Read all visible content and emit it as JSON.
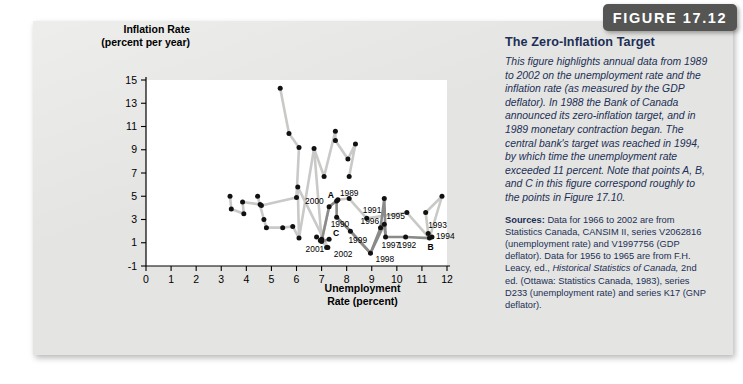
{
  "figure_tag": "FIGURE 17.12",
  "chart_data": {
    "type": "scatter",
    "title": "The Zero-Inflation Target",
    "xlabel": "Unemployment Rate (percent)",
    "xlabel_line1": "Unemployment",
    "xlabel_line2": "Rate (percent)",
    "ylabel": "Inflation Rate (percent per year)",
    "ylabel_line1": "Inflation Rate",
    "ylabel_line2": "(percent per year)",
    "xlim": [
      0,
      12
    ],
    "ylim": [
      -1,
      15
    ],
    "xticks": [
      "0",
      "1",
      "2",
      "3",
      "4",
      "5",
      "6",
      "7",
      "8",
      "9",
      "10",
      "11",
      "12"
    ],
    "yticks": [
      "-1",
      "1",
      "3",
      "5",
      "7",
      "9",
      "11",
      "13",
      "15"
    ],
    "grid": false,
    "legend": "none",
    "series": [
      {
        "name": "Unemployment vs Inflation 1956-2002",
        "points": [
          {
            "label": "",
            "x": 3.35,
            "y": 5.0
          },
          {
            "label": "",
            "x": 3.4,
            "y": 3.9
          },
          {
            "label": "",
            "x": 3.85,
            "y": 4.5
          },
          {
            "label": "",
            "x": 3.9,
            "y": 3.5
          },
          {
            "label": "",
            "x": 4.45,
            "y": 5.0
          },
          {
            "label": "",
            "x": 4.55,
            "y": 4.3
          },
          {
            "label": "",
            "x": 4.6,
            "y": 4.2
          },
          {
            "label": "",
            "x": 4.7,
            "y": 3.0
          },
          {
            "label": "",
            "x": 4.8,
            "y": 2.3
          },
          {
            "label": "",
            "x": 5.35,
            "y": 14.3
          },
          {
            "label": "",
            "x": 5.45,
            "y": 2.3
          },
          {
            "label": "",
            "x": 5.7,
            "y": 10.4
          },
          {
            "label": "",
            "x": 5.85,
            "y": 2.4
          },
          {
            "label": "",
            "x": 6.0,
            "y": 4.9
          },
          {
            "label": "",
            "x": 6.05,
            "y": 5.8
          },
          {
            "label": "",
            "x": 6.1,
            "y": 9.2
          },
          {
            "label": "",
            "x": 6.1,
            "y": 1.4
          },
          {
            "label": "",
            "x": 6.7,
            "y": 9.1
          },
          {
            "label": "",
            "x": 6.8,
            "y": 1.5
          },
          {
            "label": "",
            "x": 6.95,
            "y": 1.2
          },
          {
            "label": "",
            "x": 7.0,
            "y": 1.3
          },
          {
            "label": "2001",
            "x": 7.0,
            "y": 1.1
          },
          {
            "label": "",
            "x": 7.1,
            "y": 6.7
          },
          {
            "label": "",
            "x": 7.2,
            "y": 0.6
          },
          {
            "label": "2002",
            "x": 7.25,
            "y": 0.6
          },
          {
            "label": "C",
            "x": 7.3,
            "y": 1.3
          },
          {
            "label": "2000",
            "x": 7.3,
            "y": 4.1
          },
          {
            "label": "",
            "x": 7.55,
            "y": 10.6
          },
          {
            "label": "",
            "x": 7.55,
            "y": 9.8
          },
          {
            "label": "A",
            "x": 7.6,
            "y": 4.6
          },
          {
            "label": "1989",
            "x": 7.65,
            "y": 4.7
          },
          {
            "label": "1990",
            "x": 7.6,
            "y": 3.2
          },
          {
            "label": "",
            "x": 8.05,
            "y": 8.2
          },
          {
            "label": "",
            "x": 8.1,
            "y": 6.7
          },
          {
            "label": "",
            "x": 8.1,
            "y": 4.8
          },
          {
            "label": "1999",
            "x": 8.15,
            "y": 2.0
          },
          {
            "label": "",
            "x": 8.35,
            "y": 9.5
          },
          {
            "label": "1991",
            "x": 8.8,
            "y": 3.1
          },
          {
            "label": "1998",
            "x": 8.95,
            "y": 0.1
          },
          {
            "label": "1996",
            "x": 9.35,
            "y": 2.3
          },
          {
            "label": "",
            "x": 9.5,
            "y": 4.8
          },
          {
            "label": "1995",
            "x": 9.5,
            "y": 2.6
          },
          {
            "label": "1997",
            "x": 9.55,
            "y": 1.5
          },
          {
            "label": "1992",
            "x": 10.35,
            "y": 1.5
          },
          {
            "label": "",
            "x": 10.4,
            "y": 3.6
          },
          {
            "label": "1993",
            "x": 11.25,
            "y": 1.8
          },
          {
            "label": "B",
            "x": 11.3,
            "y": 1.4
          },
          {
            "label": "1994",
            "x": 11.4,
            "y": 1.5
          },
          {
            "label": "",
            "x": 11.15,
            "y": 3.6
          },
          {
            "label": "",
            "x": 11.8,
            "y": 5.0
          }
        ]
      }
    ],
    "annotations": [
      "A",
      "B",
      "C"
    ],
    "colors": {
      "line": "#c9c9c7",
      "line_highlight": "#8a8a88",
      "dot": "#111111",
      "panel_bg": "#e4e4e2",
      "plot_bg": "#ffffff",
      "text_blue": "#1b2f57",
      "tag_bg": "#555554"
    }
  },
  "sidebar_text": {
    "title": "The Zero-Inflation Target",
    "body": "This figure highlights annual data from 1989 to 2002 on the unemployment rate and the inflation rate (as measured by the GDP deflator). In 1988 the Bank of Canada announced its zero-inflation target, and in 1989 monetary contraction began. The central bank's target was reached in 1994, by which time the unemployment rate exceeded 11 percent. Note that points A, B, and C in this figure correspond roughly to the points in Figure 17.10.",
    "sources_label": "Sources:",
    "sources_part1": " Data for 1966 to 2002 are from Statistics Canada, CANSIM II, series V2062816 (unemployment rate) and V1997756 (GDP deflator). Data for 1956 to 1965 are from F.H. Leacy, ed., ",
    "sources_italic": "Historical Statistics of Canada,",
    "sources_part2": " 2nd ed. (Ottawa: Statistics Canada, 1983), series D233 (unemployment rate) and series K17 (GNP deflator)."
  }
}
